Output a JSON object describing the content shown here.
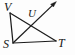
{
  "figure": {
    "kind": "geometry-line-diagram",
    "background_color": "#fdfdfd",
    "stroke_color": "#1c1c1c",
    "label_color": "#151515",
    "width": 75,
    "height": 55,
    "points": {
      "V": {
        "label": "V",
        "x": 10,
        "y": 13
      },
      "U": {
        "label": "U",
        "x": 34,
        "y": 24
      },
      "S": {
        "label": "S",
        "x": 13,
        "y": 43
      },
      "T": {
        "label": "T",
        "x": 56,
        "y": 41
      }
    },
    "segments": [
      {
        "name": "segment-VS",
        "from": "V",
        "to": "S"
      },
      {
        "name": "segment-ST",
        "from": "S",
        "to": "T"
      },
      {
        "name": "segment-VT",
        "from": "V",
        "to": "T"
      }
    ],
    "rays": [
      {
        "name": "ray-SU",
        "from": "S",
        "through": "U",
        "arrow_tip_x": 56,
        "arrow_tip_y": 2
      }
    ]
  }
}
